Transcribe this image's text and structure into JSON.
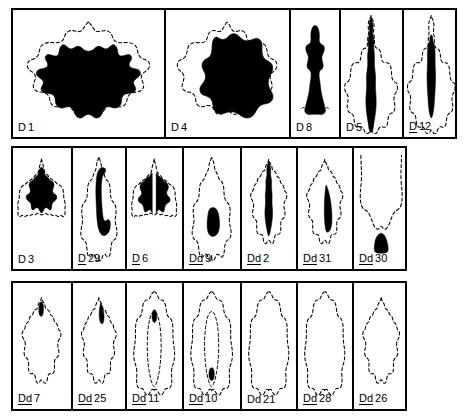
{
  "figure": {
    "kind": "rorschach-location-chart",
    "ink_color": "#000000",
    "outline_color": "#000000",
    "background_color": "#ffffff",
    "outline_style": "dashed",
    "border_width_px": 2
  },
  "rows": [
    {
      "id": "row-1",
      "x": 11,
      "y": 8,
      "width": 446,
      "height": 131,
      "cells": [
        {
          "id": "cell-d1",
          "label_prefix": "D",
          "label_num": "1",
          "prefix_underlined": false,
          "width": 151,
          "blot": "d1"
        },
        {
          "id": "cell-d4",
          "label_prefix": "D",
          "label_num": "4",
          "prefix_underlined": false,
          "width": 125,
          "blot": "d4"
        },
        {
          "id": "cell-d8",
          "label_prefix": "D",
          "label_num": "8",
          "prefix_underlined": false,
          "width": 50,
          "blot": "d8"
        },
        {
          "id": "cell-d5",
          "label_prefix": "D",
          "label_num": "5",
          "prefix_underlined": false,
          "width": 63,
          "blot": "d5"
        },
        {
          "id": "cell-d12",
          "label_prefix": "D",
          "label_num": "12",
          "prefix_underlined": true,
          "width": 57,
          "blot": "d12"
        }
      ]
    },
    {
      "id": "row-2",
      "x": 11,
      "y": 146,
      "width": 396,
      "height": 125,
      "cells": [
        {
          "id": "cell-d3",
          "label_prefix": "D",
          "label_num": "3",
          "prefix_underlined": false,
          "width": 58,
          "blot": "d3"
        },
        {
          "id": "cell-d29",
          "label_prefix": "D",
          "label_num": "29",
          "prefix_underlined": true,
          "width": 54,
          "blot": "d29"
        },
        {
          "id": "cell-d6",
          "label_prefix": "D",
          "label_num": "6",
          "prefix_underlined": true,
          "width": 57,
          "blot": "d6"
        },
        {
          "id": "cell-dd9",
          "label_prefix": "Dd",
          "label_num": "9",
          "prefix_underlined": true,
          "width": 58,
          "blot": "dd9"
        },
        {
          "id": "cell-dd2",
          "label_prefix": "Dd",
          "label_num": "2",
          "prefix_underlined": true,
          "width": 56,
          "blot": "dd2"
        },
        {
          "id": "cell-dd31",
          "label_prefix": "Dd",
          "label_num": "31",
          "prefix_underlined": true,
          "width": 56,
          "blot": "dd31"
        },
        {
          "id": "cell-dd30",
          "label_prefix": "Dd",
          "label_num": "30",
          "prefix_underlined": true,
          "width": 57,
          "blot": "dd30"
        }
      ]
    },
    {
      "id": "row-3",
      "x": 11,
      "y": 281,
      "width": 396,
      "height": 130,
      "cells": [
        {
          "id": "cell-dd7",
          "label_prefix": "Dd",
          "label_num": "7",
          "prefix_underlined": true,
          "width": 58,
          "blot": "dd7"
        },
        {
          "id": "cell-dd25",
          "label_prefix": "Dd",
          "label_num": "25",
          "prefix_underlined": true,
          "width": 54,
          "blot": "dd25"
        },
        {
          "id": "cell-dd11",
          "label_prefix": "Dd",
          "label_num": "11",
          "prefix_underlined": true,
          "width": 57,
          "blot": "dd11"
        },
        {
          "id": "cell-dd10",
          "label_prefix": "Dd",
          "label_num": "10",
          "prefix_underlined": true,
          "width": 58,
          "blot": "dd10"
        },
        {
          "id": "cell-dd21",
          "label_prefix": "Dd",
          "label_num": "21",
          "prefix_underlined": false,
          "width": 56,
          "blot": "dd21"
        },
        {
          "id": "cell-dd28",
          "label_prefix": "Dd",
          "label_num": "28",
          "prefix_underlined": true,
          "width": 56,
          "blot": "dd28"
        },
        {
          "id": "cell-dd26",
          "label_prefix": "Dd",
          "label_num": "26",
          "prefix_underlined": true,
          "width": 57,
          "blot": "dd26"
        }
      ]
    }
  ]
}
